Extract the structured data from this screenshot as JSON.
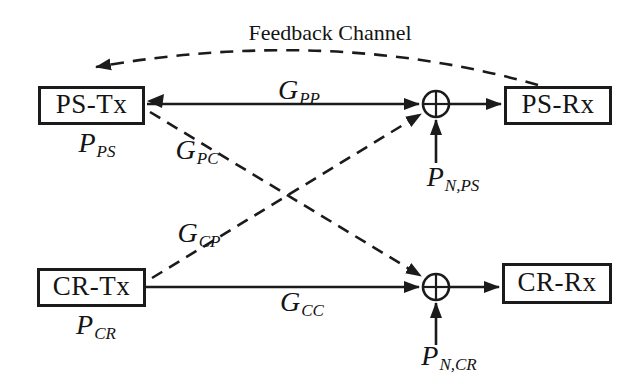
{
  "figure": {
    "background": "#ffffff",
    "ink": "#1b1b1b",
    "feedback_label": "Feedback Channel",
    "boxes": {
      "ps_tx": "PS-Tx",
      "ps_rx": "PS-Rx",
      "cr_tx": "CR-Tx",
      "cr_rx": "CR-Rx"
    },
    "powers": {
      "ps": {
        "base": "P",
        "sub": "PS"
      },
      "cr": {
        "base": "P",
        "sub": "CR"
      }
    },
    "gains": {
      "pp": {
        "base": "G",
        "sub": "PP"
      },
      "pc": {
        "base": "G",
        "sub": "PC"
      },
      "cp": {
        "base": "G",
        "sub": "CP"
      },
      "cc": {
        "base": "G",
        "sub": "CC"
      }
    },
    "noise": {
      "ps": {
        "base": "P",
        "sub": "N,PS"
      },
      "cr": {
        "base": "P",
        "sub": "N,CR"
      }
    },
    "icons": {
      "adder": "circle-plus-summation",
      "arrow": "filled-triangle-arrowhead"
    }
  }
}
